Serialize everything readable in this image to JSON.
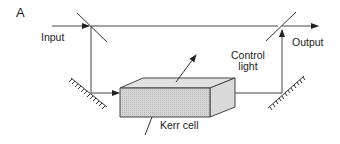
{
  "panel": {
    "label": "A"
  },
  "labels": {
    "input": "Input",
    "output": "Output",
    "control_line1": "Control",
    "control_line2": "light",
    "kerr": "Kerr cell"
  },
  "components": [
    {
      "name": "input-beamsplitter",
      "type": "beamsplitter"
    },
    {
      "name": "output-beamsplitter",
      "type": "beamsplitter"
    },
    {
      "name": "left-mirror",
      "type": "mirror"
    },
    {
      "name": "right-mirror",
      "type": "mirror"
    },
    {
      "name": "kerr-cell",
      "type": "kerr-cell"
    }
  ],
  "colors": {
    "line": "#333333",
    "cell_fill": "#cfcfcf",
    "cell_side": "#dcdcdc",
    "cell_top": "#e4e4e4"
  }
}
